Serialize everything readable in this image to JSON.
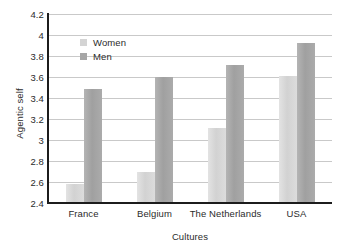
{
  "chart_data": {
    "type": "bar",
    "title": "",
    "xlabel": "Cultures",
    "ylabel": "Agentic self",
    "categories": [
      "France",
      "Belgium",
      "The Netherlands",
      "USA"
    ],
    "series": [
      {
        "name": "Women",
        "color": "#d4d4d4",
        "values": [
          2.58,
          2.7,
          3.11,
          3.61
        ]
      },
      {
        "name": "Men",
        "color": "#a6a6a6",
        "values": [
          3.49,
          3.6,
          3.71,
          3.92
        ]
      }
    ],
    "ylim": [
      2.4,
      4.2
    ],
    "yticks": [
      "2.4",
      "2.6",
      "2.8",
      "3",
      "3.2",
      "3.4",
      "3.6",
      "3.8",
      "4",
      "4.2"
    ],
    "ytick_values": [
      2.4,
      2.6,
      2.8,
      3.0,
      3.2,
      3.4,
      3.6,
      3.8,
      4.0,
      4.2
    ],
    "grid": true,
    "legend_position": "top-left-inside"
  }
}
